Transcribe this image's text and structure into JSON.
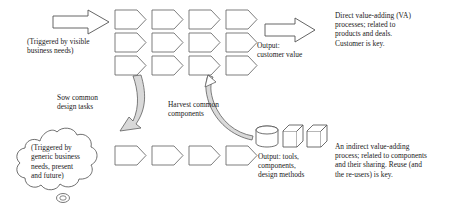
{
  "diagram": {
    "type": "process-flow-diagram",
    "colors": {
      "stroke": "#555555",
      "text": "#1a1a1a",
      "curved_arrow_fill": "#d9d9d9",
      "background": "#ffffff"
    },
    "labels": {
      "trigger_visible": "(Triggered by visible\nbusiness needs)",
      "trigger_generic": "(Triggered by\ngeneric business\nneeds, present\nand future)",
      "sow": "Sow common\ndesign tasks",
      "harvest": "Harvest common\ncomponents",
      "output_customer": "Output:\ncustomer value",
      "output_tools": "Output: tools,\ncomponents,\ndesign methods",
      "note_direct": "Direct value-adding (VA)\nprocesses; related to\nproducts and deals.\nCustomer is key.",
      "note_indirect": "An indirect value-adding\nprocess; related to components\nand their sharing. Reuse (and\nthe re-users) is key."
    },
    "shapes": {
      "input_arrow": "block-arrow-right",
      "output_arrow": "block-arrow-right",
      "cloud": "thought-cloud",
      "process_chevron": "chevron-right",
      "artifacts": [
        "cylinder",
        "cube",
        "cube"
      ],
      "sow_arrow": "curved-arrow-down-left",
      "harvest_arrow": "curved-arrow-up-left"
    },
    "rows": {
      "top_grid_rows": 3,
      "chevrons_per_row": 4,
      "bottom_row_chevrons": 4
    }
  }
}
